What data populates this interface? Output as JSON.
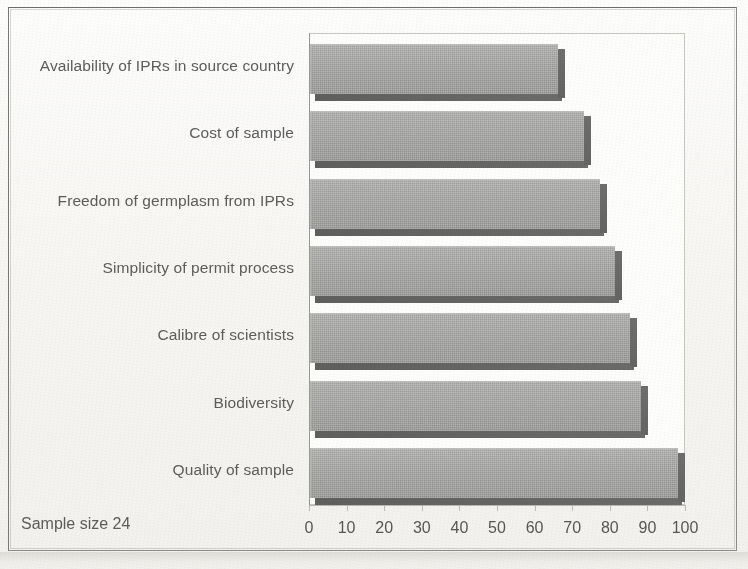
{
  "figure": {
    "note": "Sample size 24",
    "axis_max": 100,
    "axis_min": 0,
    "tick_step": 10,
    "bar_fill_color": "#a8a8a6",
    "bar_shadow_color": "#656563",
    "text_color": "#5d5d5b",
    "frame_color": "#8d8d88",
    "background_color": "#fbfbf9"
  },
  "chart_data": {
    "type": "bar",
    "orientation": "horizontal",
    "title": "",
    "subtitle": "",
    "xlabel": "",
    "ylabel": "",
    "xlim": [
      0,
      100
    ],
    "grid": false,
    "legend": false,
    "annotations": [
      "Sample size 24"
    ],
    "tick_labels": [
      "0",
      "10",
      "20",
      "30",
      "40",
      "50",
      "60",
      "70",
      "80",
      "90",
      "100"
    ],
    "ticks": [
      0,
      10,
      20,
      30,
      40,
      50,
      60,
      70,
      80,
      90,
      100
    ],
    "categories": [
      "Availability of IPRs in source country",
      "Cost of sample",
      "Freedom of germplasm from IPRs",
      "Simplicity of permit process",
      "Calibre of scientists",
      "Biodiversity",
      "Quality of sample"
    ],
    "values": [
      66,
      73,
      77,
      81,
      85,
      88,
      98
    ],
    "series": [
      {
        "name": "",
        "values": [
          66,
          73,
          77,
          81,
          85,
          88,
          98
        ]
      }
    ]
  }
}
